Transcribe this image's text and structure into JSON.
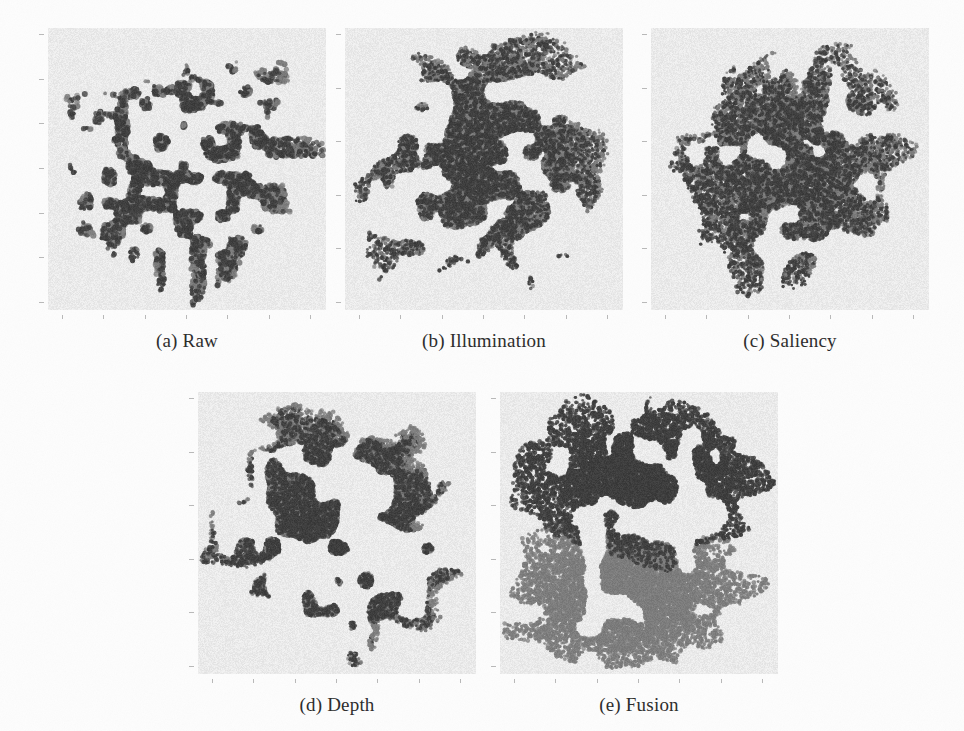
{
  "figure": {
    "background_color": "#fdfdfd",
    "panel_background_color": "#ececec",
    "tick_color": "#b9b9b9",
    "caption_color": "#2b2b2b"
  },
  "panels": [
    {
      "id": "raw",
      "caption": "(a) Raw",
      "x": 48,
      "y": 28,
      "w": 278,
      "h": 282,
      "caption_y": 330,
      "n_ticks_y": 7,
      "n_ticks_x": 7
    },
    {
      "id": "illumination",
      "caption": "(b) Illumination",
      "x": 345,
      "y": 28,
      "w": 278,
      "h": 282,
      "caption_y": 330,
      "n_ticks_y": 6,
      "n_ticks_x": 7
    },
    {
      "id": "saliency",
      "caption": "(c) Saliency",
      "x": 651,
      "y": 28,
      "w": 278,
      "h": 282,
      "caption_y": 330,
      "n_ticks_y": 6,
      "n_ticks_x": 7
    },
    {
      "id": "depth",
      "caption": "(d) Depth",
      "x": 198,
      "y": 392,
      "w": 278,
      "h": 282,
      "caption_y": 694,
      "n_ticks_y": 6,
      "n_ticks_x": 7
    },
    {
      "id": "fusion",
      "caption": "(e) Fusion",
      "x": 500,
      "y": 392,
      "w": 278,
      "h": 282,
      "caption_y": 694,
      "n_ticks_y": 6,
      "n_ticks_x": 7
    }
  ],
  "chart_data": {
    "type": "scatter",
    "xlabel": "",
    "ylabel": "",
    "grid": false,
    "legend": "none",
    "axis_ticks_labeled": false,
    "classes": [
      {
        "name": "class-1",
        "color": "#3d3d3d",
        "marker": "point"
      },
      {
        "name": "class-2",
        "color": "#7c7c7c",
        "marker": "point"
      }
    ],
    "subplots": [
      {
        "id": "raw",
        "label": "(a) Raw",
        "description": "Sparse speckled scatter, two classes thoroughly intermixed; many small isolated blobs spread over a roughly circular region with low density.",
        "n_points_per_class": 2600,
        "separation": "none",
        "density": "sparse",
        "layout": "uniform-disc",
        "cluster_centers": [
          [
            0.5,
            0.5
          ],
          [
            0.5,
            0.5
          ]
        ],
        "spread": [
          0.27,
          0.27
        ]
      },
      {
        "id": "illumination",
        "label": "(b) Illumination",
        "description": "Dense overlapping cloud with ragged spiky boundary; two classes mixed with no visible split.",
        "n_points_per_class": 6500,
        "separation": "none",
        "density": "dense",
        "layout": "ragged-disc",
        "cluster_centers": [
          [
            0.5,
            0.47
          ],
          [
            0.5,
            0.47
          ]
        ],
        "spread": [
          0.26,
          0.26
        ]
      },
      {
        "id": "saliency",
        "label": "(c) Saliency",
        "description": "Dense mottled cloud with lace-like voids; classes intermixed, slightly more structure than (b).",
        "n_points_per_class": 6000,
        "separation": "none",
        "density": "dense",
        "layout": "ragged-disc",
        "cluster_centers": [
          [
            0.5,
            0.5
          ],
          [
            0.5,
            0.5
          ]
        ],
        "spread": [
          0.26,
          0.26
        ]
      },
      {
        "id": "depth",
        "label": "(d) Depth",
        "description": "Dense cloud with spiky arms and a few detached fragments at the left; classes still intermixed.",
        "n_points_per_class": 6200,
        "separation": "none",
        "density": "dense",
        "layout": "ragged-disc",
        "cluster_centers": [
          [
            0.52,
            0.5
          ],
          [
            0.52,
            0.5
          ]
        ],
        "spread": [
          0.25,
          0.26
        ]
      },
      {
        "id": "fusion",
        "label": "(e) Fusion",
        "description": "Two clearly separated blobs: a dark cluster occupying the upper half and a lighter gray cluster in the lower half, divided by a horizontal gap.",
        "n_points_per_class": 7000,
        "separation": "clear",
        "density": "very-dense",
        "layout": "two-blobs",
        "cluster_centers": [
          [
            0.52,
            0.3
          ],
          [
            0.46,
            0.72
          ]
        ],
        "spread": [
          0.24,
          0.24
        ]
      }
    ]
  }
}
